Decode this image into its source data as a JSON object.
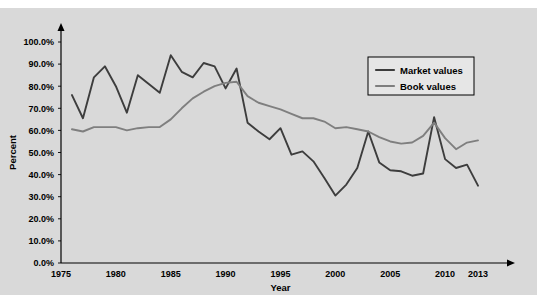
{
  "chart_data": {
    "type": "line",
    "title": "",
    "xlabel": "Year",
    "ylabel": "Percent",
    "xlim": [
      1975,
      2013
    ],
    "ylim": [
      0,
      100
    ],
    "grid": false,
    "legend_position": "top-right",
    "y_tick_labels": [
      "100.0%",
      "90.0%",
      "80.0%",
      "70.0%",
      "60.0%",
      "50.0%",
      "40.0%",
      "30.0%",
      "20.0%",
      "10.0%",
      "0.0%"
    ],
    "y_tick_values": [
      100,
      90,
      80,
      70,
      60,
      50,
      40,
      30,
      20,
      10,
      0
    ],
    "x_tick_labels": [
      "1975",
      "1980",
      "1985",
      "1990",
      "1995",
      "2000",
      "2005",
      "2010",
      "2013"
    ],
    "x_tick_values": [
      1975,
      1980,
      1985,
      1990,
      1995,
      2000,
      2005,
      2010,
      2013
    ],
    "x": [
      1976,
      1977,
      1978,
      1979,
      1980,
      1981,
      1982,
      1983,
      1984,
      1985,
      1986,
      1987,
      1988,
      1989,
      1990,
      1991,
      1992,
      1993,
      1994,
      1995,
      1996,
      1997,
      1998,
      1999,
      2000,
      2001,
      2002,
      2003,
      2004,
      2005,
      2006,
      2007,
      2008,
      2009,
      2010,
      2011,
      2012,
      2013
    ],
    "series": [
      {
        "name": "Market values",
        "color": "#3d3d3d",
        "width": 1.9,
        "values": [
          76.0,
          65.5,
          84.0,
          89.0,
          80.0,
          68.0,
          85.0,
          81.0,
          77.0,
          94.0,
          86.5,
          84.0,
          90.5,
          89.0,
          79.0,
          88.0,
          63.5,
          59.5,
          56.0,
          61.0,
          49.0,
          50.5,
          46.0,
          38.5,
          30.5,
          35.5,
          43.0,
          59.5,
          45.5,
          42.0,
          41.5,
          39.5,
          40.5,
          66.0,
          47.0,
          43.0,
          44.5,
          35.0
        ]
      },
      {
        "name": "Book values",
        "color": "#7f7f7f",
        "width": 1.9,
        "values": [
          60.5,
          59.5,
          61.5,
          61.5,
          61.5,
          60.0,
          61.0,
          61.5,
          61.5,
          65.0,
          70.0,
          74.5,
          77.5,
          80.0,
          81.5,
          82.0,
          75.5,
          72.5,
          71.0,
          69.5,
          67.5,
          65.5,
          65.5,
          64.0,
          61.0,
          61.5,
          60.5,
          59.5,
          57.0,
          55.0,
          54.0,
          54.5,
          57.5,
          63.5,
          56.5,
          51.5,
          54.5,
          55.5
        ]
      }
    ],
    "legend": [
      {
        "label": "Market values",
        "color": "#3d3d3d"
      },
      {
        "label": "Book values",
        "color": "#7f7f7f"
      }
    ]
  }
}
